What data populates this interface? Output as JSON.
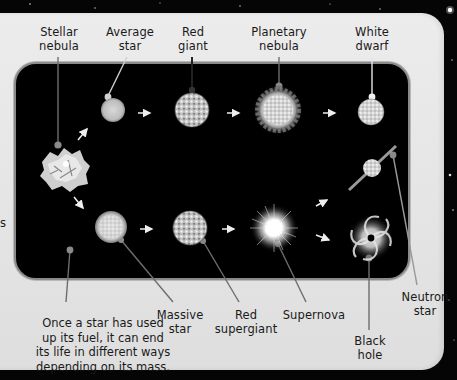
{
  "colors": {
    "background": "#050505",
    "panel": "#e6e6e6",
    "inner_box": "#000000",
    "inner_border": "#8a8a8a",
    "pointer_line": "#6e6e6e",
    "text": "#1a1a1a"
  },
  "labels": {
    "stellar_nebula": "Stellar\nnebula",
    "average_star": "Average\nstar",
    "red_giant": "Red\ngiant",
    "planetary_nebula": "Planetary\nnebula",
    "white_dwarf": "White\ndwarf",
    "massive_star": "Massive\nstar",
    "red_supergiant": "Red\nsupergiant",
    "supernova": "Supernova",
    "black_hole": "Black\nhole",
    "neutron_star": "Neutron\nstar"
  },
  "note": "Once a star has used\nup its fuel, it can end\nits life in different ways\ndepending on its mass.",
  "cropped_left_text": "s",
  "stages": {
    "average_path": [
      "Stellar nebula",
      "Average star",
      "Red giant",
      "Planetary nebula",
      "White dwarf"
    ],
    "massive_path": [
      "Stellar nebula",
      "Massive star",
      "Red supergiant",
      "Supernova",
      [
        "Neutron star",
        "Black hole"
      ]
    ]
  }
}
